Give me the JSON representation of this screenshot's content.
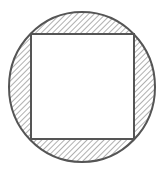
{
  "diagram": {
    "title": "",
    "canvas": {
      "width": 166,
      "height": 174
    },
    "colors": {
      "background": "#ffffff",
      "stroke": "#555555",
      "hatch": "#7a7a7a",
      "square_fill": "#ffffff"
    },
    "circle": {
      "cx": 82,
      "cy": 87,
      "rx": 73,
      "ry": 75,
      "stroke_width": 2
    },
    "square": {
      "x": 31,
      "y": 34,
      "width": 103,
      "height": 105,
      "stroke_width": 2
    },
    "hatch": {
      "spacing": 4,
      "angle": 45,
      "stroke_width": 1.2
    }
  }
}
